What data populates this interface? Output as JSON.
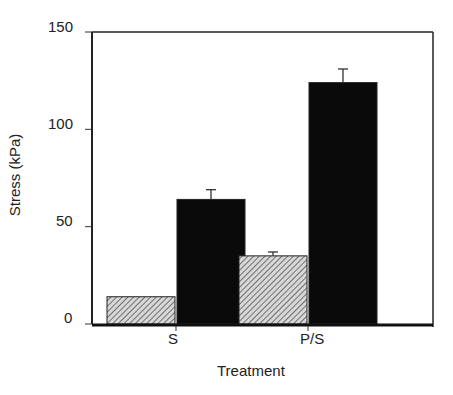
{
  "chart_data": {
    "type": "bar",
    "title": "",
    "xlabel": "Treatment",
    "ylabel": "Stress (kPa)",
    "ylim": [
      0,
      150
    ],
    "yticks": [
      0,
      50,
      100,
      150
    ],
    "grid": false,
    "legend": null,
    "categories": [
      "S",
      "P/S"
    ],
    "series": [
      {
        "name": "hatched",
        "pattern": "diagonal-hatch",
        "color": "#9a9a9a",
        "values": [
          14,
          35
        ],
        "errors": [
          null,
          2
        ]
      },
      {
        "name": "solid",
        "pattern": "solid",
        "color": "#0a0a0a",
        "values": [
          64,
          124
        ],
        "errors": [
          5,
          7
        ]
      }
    ]
  },
  "labels": {
    "xlabel": "Treatment",
    "ylabel": "Stress (kPa)",
    "ticks": [
      "150",
      "100",
      "50",
      "0"
    ],
    "categories": [
      "S",
      "P/S"
    ]
  }
}
